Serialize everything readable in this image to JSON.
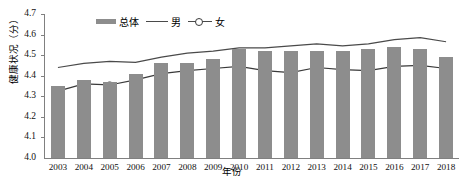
{
  "chart_data": {
    "type": "bar",
    "title": "",
    "xlabel": "年份",
    "ylabel": "健康状况（分）",
    "categories": [
      "2003",
      "2004",
      "2005",
      "2006",
      "2007",
      "2008",
      "2009",
      "2010",
      "2011",
      "2012",
      "2013",
      "2014",
      "2015",
      "2016",
      "2017",
      "2018"
    ],
    "ylim": [
      4.0,
      4.7
    ],
    "yticks": [
      "4.0",
      "4.1",
      "4.2",
      "4.3",
      "4.4",
      "4.5",
      "4.6",
      "4.7"
    ],
    "grid": false,
    "legend_position": "top-center",
    "series": [
      {
        "name": "总体",
        "type": "bar",
        "values": [
          4.35,
          4.38,
          4.37,
          4.41,
          4.46,
          4.46,
          4.48,
          4.53,
          4.52,
          4.52,
          4.52,
          4.52,
          4.53,
          4.54,
          4.53,
          4.49
        ]
      },
      {
        "name": "男",
        "type": "line",
        "values": [
          4.44,
          4.46,
          4.47,
          4.465,
          4.49,
          4.51,
          4.52,
          4.535,
          4.535,
          4.545,
          4.555,
          4.545,
          4.555,
          4.575,
          4.585,
          4.565
        ]
      },
      {
        "name": "女",
        "type": "line",
        "marker": "open-circle",
        "values": [
          4.325,
          4.36,
          4.355,
          4.38,
          4.41,
          4.425,
          4.435,
          4.445,
          4.425,
          4.415,
          4.44,
          4.43,
          4.425,
          4.445,
          4.45,
          4.435
        ]
      }
    ],
    "colors": {
      "bar": "#8d8d8d",
      "line_male": "#4a4a4a",
      "line_female": "#3a3a3a",
      "axis": "#808080",
      "text": "#111111"
    }
  },
  "legend": {
    "items": [
      {
        "label": "总体",
        "marker": "bar-swatch"
      },
      {
        "label": "男",
        "marker": "line-swatch"
      },
      {
        "label": "女",
        "marker": "line-circle-swatch"
      }
    ]
  }
}
